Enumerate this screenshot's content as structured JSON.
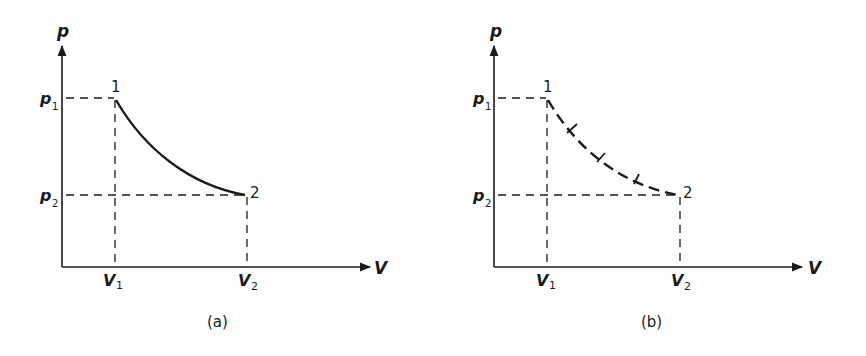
{
  "figure": {
    "panels": [
      {
        "id": "a",
        "caption": "(a)",
        "y_axis_label": "p",
        "x_axis_label": "V",
        "p1_label": "p",
        "p1_sub": "1",
        "p2_label": "p",
        "p2_sub": "2",
        "v1_label": "V",
        "v1_sub": "1",
        "v2_label": "V",
        "v2_sub": "2",
        "state1_label": "1",
        "state2_label": "2",
        "curve_style": "solid"
      },
      {
        "id": "b",
        "caption": "(b)",
        "y_axis_label": "p",
        "x_axis_label": "V",
        "p1_label": "p",
        "p1_sub": "1",
        "p2_label": "p",
        "p2_sub": "2",
        "v1_label": "V",
        "v1_sub": "1",
        "v2_label": "V",
        "v2_sub": "2",
        "state1_label": "1",
        "state2_label": "2",
        "curve_style": "dashed with cross ticks"
      }
    ],
    "colors": {
      "ink": "#1a1a1a",
      "background": "#ffffff"
    }
  }
}
